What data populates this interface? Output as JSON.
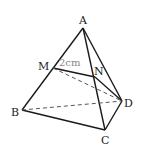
{
  "diagram": {
    "type": "tetrahedron",
    "vertices": {
      "A": {
        "label": "A",
        "x": 83,
        "y": 28
      },
      "B": {
        "label": "B",
        "x": 22,
        "y": 110
      },
      "C": {
        "label": "C",
        "x": 105,
        "y": 130
      },
      "D": {
        "label": "D",
        "x": 122,
        "y": 101
      },
      "M": {
        "label": "M",
        "x": 53,
        "y": 68
      },
      "N": {
        "label": "N",
        "x": 95,
        "y": 77
      }
    },
    "solid_edges": [
      [
        "A",
        "B"
      ],
      [
        "A",
        "C"
      ],
      [
        "A",
        "D"
      ],
      [
        "B",
        "C"
      ],
      [
        "C",
        "D"
      ],
      [
        "M",
        "N"
      ],
      [
        "N",
        "D"
      ]
    ],
    "dashed_edges": [
      [
        "B",
        "D"
      ],
      [
        "M",
        "D"
      ]
    ],
    "measurement": {
      "label": "2cm",
      "segment": [
        "M",
        "N"
      ]
    },
    "colors": {
      "line": "#1a1a1a",
      "dash": "#555555",
      "dim_text": "#888888"
    }
  }
}
